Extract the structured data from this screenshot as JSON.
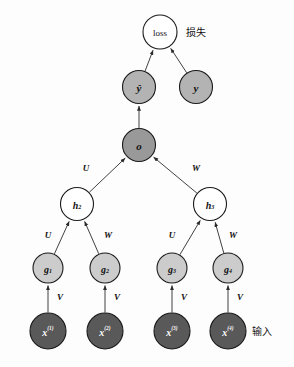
{
  "diagram": {
    "background_color": "#fdfdfd",
    "side_labels": [
      {
        "id": "loss-cn",
        "text": "损失",
        "x": 186,
        "y": 32
      },
      {
        "id": "input-cn",
        "text": "输入",
        "x": 252,
        "y": 331
      }
    ],
    "nodes": [
      {
        "id": "loss",
        "label": "loss",
        "sub": "",
        "sup": "",
        "x": 160,
        "y": 32,
        "r": 17,
        "fill": "#ffffff",
        "text_color": "#111111",
        "style": "plain",
        "font_size": 9
      },
      {
        "id": "yhat",
        "label": "ŷ",
        "sub": "",
        "sup": "",
        "x": 139,
        "y": 87,
        "r": 16.5,
        "fill": "#b3b3b3",
        "text_color": "#111111",
        "style": "italic",
        "font_size": 11
      },
      {
        "id": "y",
        "label": "y",
        "sub": "",
        "sup": "",
        "x": 196,
        "y": 87,
        "r": 16.5,
        "fill": "#b3b3b3",
        "text_color": "#111111",
        "style": "italic",
        "font_size": 11
      },
      {
        "id": "o",
        "label": "o",
        "sub": "",
        "sup": "",
        "x": 139,
        "y": 145,
        "r": 16.5,
        "fill": "#999999",
        "text_color": "#111111",
        "style": "italic",
        "font_size": 11
      },
      {
        "id": "h2",
        "label": "h",
        "sub": "2",
        "sup": "",
        "x": 77,
        "y": 204,
        "r": 16.5,
        "fill": "#ffffff",
        "text_color": "#111111",
        "style": "italic",
        "font_size": 10
      },
      {
        "id": "h3",
        "label": "h",
        "sub": "3",
        "sup": "",
        "x": 210,
        "y": 204,
        "r": 16.5,
        "fill": "#ffffff",
        "text_color": "#111111",
        "style": "italic",
        "font_size": 10
      },
      {
        "id": "g1",
        "label": "g",
        "sub": "1",
        "sup": "",
        "x": 48,
        "y": 268,
        "r": 15,
        "fill": "#cccccc",
        "text_color": "#111111",
        "style": "italic",
        "font_size": 10
      },
      {
        "id": "g2",
        "label": "g",
        "sub": "2",
        "sup": "",
        "x": 105,
        "y": 268,
        "r": 15,
        "fill": "#cccccc",
        "text_color": "#111111",
        "style": "italic",
        "font_size": 10
      },
      {
        "id": "g3",
        "label": "g",
        "sub": "3",
        "sup": "",
        "x": 172,
        "y": 268,
        "r": 15,
        "fill": "#cccccc",
        "text_color": "#111111",
        "style": "italic",
        "font_size": 10
      },
      {
        "id": "g4",
        "label": "g",
        "sub": "4",
        "sup": "",
        "x": 228,
        "y": 268,
        "r": 15,
        "fill": "#cccccc",
        "text_color": "#111111",
        "style": "italic",
        "font_size": 10
      },
      {
        "id": "x1",
        "label": "x",
        "sub": "",
        "sup": "(1)",
        "x": 48,
        "y": 331,
        "r": 18,
        "fill": "#595959",
        "text_color": "#ffffff",
        "style": "italic",
        "font_size": 10
      },
      {
        "id": "x2",
        "label": "x",
        "sub": "",
        "sup": "(2)",
        "x": 105,
        "y": 331,
        "r": 18,
        "fill": "#595959",
        "text_color": "#ffffff",
        "style": "italic",
        "font_size": 10
      },
      {
        "id": "x3",
        "label": "x",
        "sub": "",
        "sup": "(3)",
        "x": 172,
        "y": 331,
        "r": 18,
        "fill": "#595959",
        "text_color": "#ffffff",
        "style": "italic",
        "font_size": 10
      },
      {
        "id": "x4",
        "label": "x",
        "sub": "",
        "sup": "(4)",
        "x": 228,
        "y": 331,
        "r": 18,
        "fill": "#595959",
        "text_color": "#ffffff",
        "style": "italic",
        "font_size": 10
      }
    ],
    "edges": [
      {
        "id": "yhat-loss",
        "from": "yhat",
        "to": "loss",
        "label": "",
        "label_x": 0,
        "label_y": 0
      },
      {
        "id": "y-loss",
        "from": "y",
        "to": "loss",
        "label": "",
        "label_x": 0,
        "label_y": 0
      },
      {
        "id": "o-yhat",
        "from": "o",
        "to": "yhat",
        "label": "",
        "label_x": 0,
        "label_y": 0
      },
      {
        "id": "h2-o",
        "from": "h2",
        "to": "o",
        "label": "U",
        "label_x": 86,
        "label_y": 168
      },
      {
        "id": "h3-o",
        "from": "h3",
        "to": "o",
        "label": "W",
        "label_x": 196,
        "label_y": 168
      },
      {
        "id": "g1-h2",
        "from": "g1",
        "to": "h2",
        "label": "U",
        "label_x": 48,
        "label_y": 235
      },
      {
        "id": "g2-h2",
        "from": "g2",
        "to": "h2",
        "label": "W",
        "label_x": 108,
        "label_y": 235
      },
      {
        "id": "g3-h3",
        "from": "g3",
        "to": "h3",
        "label": "U",
        "label_x": 172,
        "label_y": 235
      },
      {
        "id": "g4-h3",
        "from": "g4",
        "to": "h3",
        "label": "W",
        "label_x": 233,
        "label_y": 235
      },
      {
        "id": "x1-g1",
        "from": "x1",
        "to": "g1",
        "label": "V",
        "label_x": 60,
        "label_y": 297
      },
      {
        "id": "x2-g2",
        "from": "x2",
        "to": "g2",
        "label": "V",
        "label_x": 117,
        "label_y": 297
      },
      {
        "id": "x3-g3",
        "from": "x3",
        "to": "g3",
        "label": "V",
        "label_x": 184,
        "label_y": 297
      },
      {
        "id": "x4-g4",
        "from": "x4",
        "to": "g4",
        "label": "V",
        "label_x": 240,
        "label_y": 297
      }
    ]
  }
}
